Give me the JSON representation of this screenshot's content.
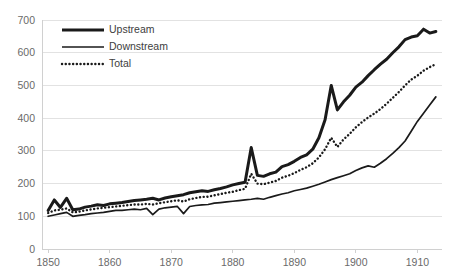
{
  "chart_data": {
    "type": "line",
    "title": "",
    "subtitle": "",
    "xlabel": "",
    "ylabel": "",
    "xlim": [
      1849,
      1914
    ],
    "ylim": [
      0,
      700
    ],
    "ytick_labels": [
      "0",
      "100",
      "200",
      "300",
      "400",
      "500",
      "600",
      "700"
    ],
    "ytick_values": [
      0,
      100,
      200,
      300,
      400,
      500,
      600,
      700
    ],
    "xtick_labels": [
      "1850",
      "1860",
      "1870",
      "1880",
      "1890",
      "1900",
      "1910"
    ],
    "xtick_values": [
      1850,
      1860,
      1870,
      1880,
      1890,
      1900,
      1910
    ],
    "grid": "horizontal",
    "legend_position": "top-left",
    "legend": [
      {
        "name": "Upstream",
        "style": "solid-thick",
        "color": "#1a1a1a"
      },
      {
        "name": "Downstream",
        "style": "solid-thin",
        "color": "#1a1a1a"
      },
      {
        "name": "Total",
        "style": "dotted",
        "color": "#1a1a1a"
      }
    ],
    "x": [
      1850,
      1851,
      1852,
      1853,
      1854,
      1855,
      1856,
      1857,
      1858,
      1859,
      1860,
      1861,
      1862,
      1863,
      1864,
      1865,
      1866,
      1867,
      1868,
      1869,
      1870,
      1871,
      1872,
      1873,
      1874,
      1875,
      1876,
      1877,
      1878,
      1879,
      1880,
      1881,
      1882,
      1883,
      1884,
      1885,
      1886,
      1887,
      1888,
      1889,
      1890,
      1891,
      1892,
      1893,
      1894,
      1895,
      1896,
      1897,
      1898,
      1899,
      1900,
      1901,
      1902,
      1903,
      1904,
      1905,
      1906,
      1907,
      1908,
      1909,
      1910,
      1911,
      1912,
      1913
    ],
    "series": [
      {
        "name": "Upstream",
        "values": [
          118,
          150,
          127,
          155,
          120,
          122,
          128,
          131,
          135,
          133,
          138,
          140,
          142,
          145,
          148,
          150,
          152,
          155,
          150,
          156,
          160,
          163,
          166,
          172,
          175,
          178,
          176,
          181,
          185,
          190,
          196,
          200,
          204,
          310,
          225,
          222,
          230,
          235,
          252,
          258,
          268,
          280,
          288,
          305,
          340,
          395,
          500,
          425,
          450,
          470,
          495,
          510,
          530,
          548,
          565,
          580,
          600,
          618,
          640,
          648,
          652,
          672,
          660,
          665
        ]
      },
      {
        "name": "Downstream",
        "values": [
          100,
          104,
          108,
          112,
          100,
          103,
          105,
          108,
          110,
          112,
          115,
          118,
          118,
          120,
          122,
          120,
          124,
          105,
          122,
          126,
          128,
          130,
          108,
          130,
          133,
          135,
          136,
          140,
          142,
          144,
          146,
          148,
          150,
          152,
          155,
          152,
          158,
          163,
          168,
          172,
          178,
          182,
          186,
          192,
          198,
          205,
          212,
          218,
          224,
          230,
          240,
          248,
          254,
          250,
          262,
          276,
          292,
          310,
          330,
          360,
          390,
          415,
          440,
          465
        ]
      },
      {
        "name": "Total",
        "values": [
          110,
          118,
          120,
          124,
          112,
          114,
          118,
          121,
          124,
          126,
          128,
          130,
          132,
          134,
          136,
          136,
          138,
          136,
          140,
          143,
          146,
          149,
          145,
          152,
          156,
          159,
          160,
          164,
          168,
          172,
          175,
          180,
          184,
          230,
          200,
          198,
          203,
          208,
          218,
          224,
          232,
          242,
          250,
          262,
          280,
          305,
          340,
          312,
          335,
          352,
          372,
          388,
          402,
          414,
          428,
          444,
          462,
          480,
          500,
          518,
          530,
          545,
          556,
          565
        ]
      }
    ]
  }
}
